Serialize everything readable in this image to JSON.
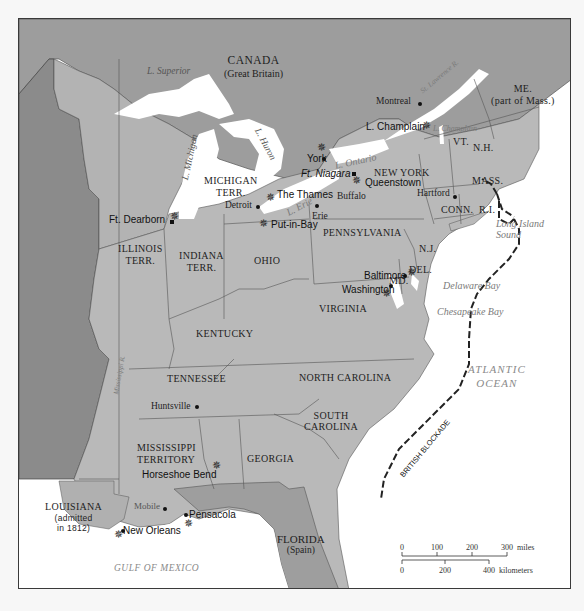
{
  "map": {
    "regions": {
      "canada": "CANADA",
      "canada_sub": "(Great Britain)",
      "florida": "FLORIDA",
      "florida_sub": "(Spain)"
    },
    "states": {
      "maine": "ME.",
      "maine_sub": "(part of Mass.)",
      "vermont": "VT.",
      "new_hampshire": "N.H.",
      "massachusetts": "MASS.",
      "connecticut": "CONN.",
      "rhode_island": "R.I.",
      "new_york": "NEW YORK",
      "pennsylvania": "PENNSYLVANIA",
      "new_jersey": "N.J.",
      "delaware": "DEL.",
      "maryland": "MD.",
      "virginia": "VIRGINIA",
      "north_carolina": "NORTH CAROLINA",
      "south_carolina_1": "SOUTH",
      "south_carolina_2": "CAROLINA",
      "georgia": "GEORGIA",
      "kentucky": "KENTUCKY",
      "tennessee": "TENNESSEE",
      "ohio": "OHIO",
      "michigan_1": "MICHIGAN",
      "michigan_2": "TERR.",
      "indiana_1": "INDIANA",
      "indiana_2": "TERR.",
      "illinois_1": "ILLINOIS",
      "illinois_2": "TERR.",
      "mississippi_1": "MISSISSIPPI",
      "mississippi_2": "TERRITORY",
      "louisiana": "LOUISIANA",
      "louisiana_sub_1": "(admitted",
      "louisiana_sub_2": "in 1812)"
    },
    "cities": {
      "montreal": "Montreal",
      "detroit": "Detroit",
      "erie": "Erie",
      "buffalo": "Buffalo",
      "hartford": "Hartford",
      "huntsville": "Huntsville",
      "mobile": "Mobile"
    },
    "battles": {
      "l_champlain": "L. Champlain",
      "york": "York",
      "ft_niagara": "Ft. Niagara",
      "queenstown": "Queenstown",
      "the_thames": "The Thames",
      "put_in_bay": "Put-in-Bay",
      "ft_dearborn": "Ft. Dearborn",
      "baltimore": "Baltimore",
      "washington": "Washington",
      "horseshoe_bend": "Horseshoe Bend",
      "pensacola": "Pensacola",
      "new_orleans": "New Orleans"
    },
    "water": {
      "l_superior": "L. Superior",
      "l_michigan": "L. Michigan",
      "l_huron": "L. Huron",
      "l_erie": "L. Erie",
      "l_ontario": "L. Ontario",
      "l_champlain": "L. Champlain",
      "st_lawrence": "St. Lawrence R.",
      "mississippi_r": "Mississippi R.",
      "long_island_sound_1": "Long Island",
      "long_island_sound_2": "Sound",
      "delaware_bay": "Delaware Bay",
      "chesapeake_bay": "Chesapeake Bay",
      "atlantic_1": "ATLANTIC",
      "atlantic_2": "OCEAN",
      "gulf": "GULF OF MEXICO"
    },
    "blockade_label": "BRITISH BLOCKADE",
    "scale": {
      "miles_ticks": [
        "0",
        "100",
        "200",
        "300"
      ],
      "miles_unit": "miles",
      "km_ticks": [
        "0",
        "200",
        "400"
      ],
      "km_unit": "kilometers"
    },
    "colors": {
      "us_land": "#b9b9b9",
      "foreign_land": "#9a9a9a",
      "louisiana_purchase": "#8a8a8a",
      "water": "#ffffff",
      "border": "#555555"
    }
  }
}
